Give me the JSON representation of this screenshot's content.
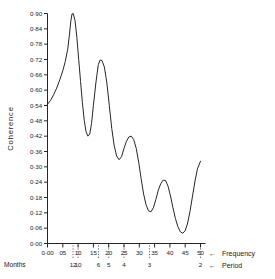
{
  "chart_data": {
    "type": "line",
    "title": "",
    "subtitle": "",
    "xlabel": "Frequency",
    "ylabel": "Coherence",
    "secondary_xlabel": "Period",
    "secondary_xunits": "Months",
    "xlim": [
      0.0,
      0.5
    ],
    "ylim": [
      0.0,
      0.9
    ],
    "grid": false,
    "legend": null,
    "x_tick_labels": [
      "0·00",
      "05",
      "10",
      "15",
      "20",
      "25",
      "30",
      "35",
      "40",
      "45",
      "50"
    ],
    "x_tick_values": [
      0.0,
      0.05,
      0.1,
      0.15,
      0.2,
      0.25,
      0.3,
      0.35,
      0.4,
      0.45,
      0.5
    ],
    "y_tick_labels": [
      "0·00",
      "0·06",
      "0·12",
      "0·18",
      "0·24",
      "0·30",
      "0·36",
      "0·42",
      "0·48",
      "0·54",
      "0·60",
      "0·66",
      "0·72",
      "0·78",
      "0·84",
      "0·90"
    ],
    "y_tick_values": [
      0.0,
      0.06,
      0.12,
      0.18,
      0.24,
      0.3,
      0.36,
      0.42,
      0.48,
      0.54,
      0.6,
      0.66,
      0.72,
      0.78,
      0.84,
      0.9
    ],
    "period_tick_labels": [
      "12",
      "10",
      "6",
      "5",
      "4",
      "3",
      "2"
    ],
    "period_tick_frequencies": [
      0.0833,
      0.1,
      0.1667,
      0.2,
      0.25,
      0.3333,
      0.5
    ],
    "frequency_arrow_glyph": "←",
    "period_arrow_glyph": "←",
    "series": [
      {
        "name": "coherence",
        "color": "#262626",
        "x": [
          0.0,
          0.01,
          0.02,
          0.03,
          0.04,
          0.05,
          0.058,
          0.066,
          0.072,
          0.076,
          0.08,
          0.084,
          0.09,
          0.096,
          0.102,
          0.108,
          0.114,
          0.12,
          0.126,
          0.132,
          0.138,
          0.144,
          0.15,
          0.158,
          0.166,
          0.172,
          0.178,
          0.186,
          0.194,
          0.202,
          0.21,
          0.218,
          0.226,
          0.234,
          0.242,
          0.25,
          0.258,
          0.266,
          0.274,
          0.282,
          0.29,
          0.298,
          0.306,
          0.314,
          0.322,
          0.33,
          0.338,
          0.346,
          0.354,
          0.362,
          0.37,
          0.378,
          0.386,
          0.394,
          0.402,
          0.41,
          0.418,
          0.426,
          0.434,
          0.442,
          0.45,
          0.458,
          0.466,
          0.474,
          0.482,
          0.49,
          0.5
        ],
        "y": [
          0.545,
          0.56,
          0.582,
          0.608,
          0.64,
          0.676,
          0.712,
          0.76,
          0.82,
          0.868,
          0.898,
          0.9,
          0.872,
          0.806,
          0.72,
          0.634,
          0.552,
          0.482,
          0.437,
          0.42,
          0.428,
          0.47,
          0.54,
          0.628,
          0.7,
          0.718,
          0.716,
          0.69,
          0.628,
          0.54,
          0.45,
          0.382,
          0.342,
          0.328,
          0.34,
          0.372,
          0.4,
          0.417,
          0.42,
          0.406,
          0.372,
          0.318,
          0.254,
          0.194,
          0.152,
          0.128,
          0.124,
          0.14,
          0.172,
          0.208,
          0.234,
          0.248,
          0.246,
          0.224,
          0.186,
          0.14,
          0.098,
          0.066,
          0.046,
          0.04,
          0.05,
          0.08,
          0.128,
          0.186,
          0.244,
          0.292,
          0.322
        ]
      }
    ],
    "annotations": [
      {
        "text": "peak",
        "x": 0.084,
        "y": 0.9
      },
      {
        "text": "second-peak",
        "x": 0.174,
        "y": 0.72
      },
      {
        "text": "minimum",
        "x": 0.442,
        "y": 0.04
      }
    ]
  },
  "axes": {
    "y_axis_title": "Coherence",
    "frequency_label": "Frequency",
    "period_label": "Period",
    "months_label": "Months"
  }
}
